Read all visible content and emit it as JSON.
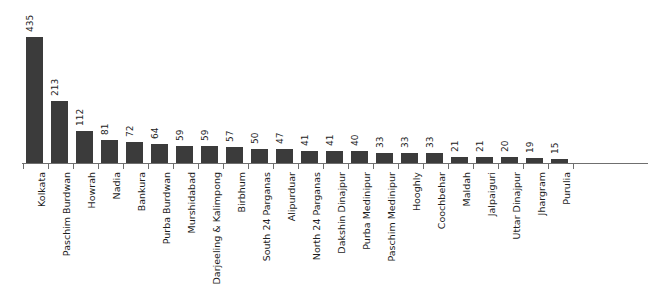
{
  "chart_data": {
    "type": "bar",
    "title": "",
    "subtitle": "",
    "xlabel": "",
    "ylabel": "",
    "ylim": [
      0,
      435
    ],
    "grid": false,
    "legend": "none",
    "orientation": "vertical",
    "bar_color": "#3b3b3b",
    "background_color": "#ffffff",
    "axis_color": "#6f6f6f",
    "label_rotation_degrees": 90,
    "value_labels_shown": true,
    "categories": [
      "Kolkata",
      "Paschim Burdwan",
      "Howrah",
      "Nadia",
      "Bankura",
      "Purba Burdwan",
      "Murshidabad",
      "Darjeeling & Kalimpong",
      "Birbhum",
      "South 24 Parganas",
      "Alipurduar",
      "North 24 Parganas",
      "Dakshin Dinajpur",
      "Purba Medinipur",
      "Paschim Medinipur",
      "Hooghly",
      "Coochbehar",
      "Maldah",
      "Jalpaiguri",
      "Uttar Dinajpur",
      "Jhargram",
      "Purulia"
    ],
    "values": [
      435,
      213,
      112,
      81,
      72,
      64,
      59,
      59,
      57,
      50,
      47,
      41,
      41,
      40,
      33,
      33,
      33,
      21,
      21,
      20,
      19,
      15
    ]
  }
}
